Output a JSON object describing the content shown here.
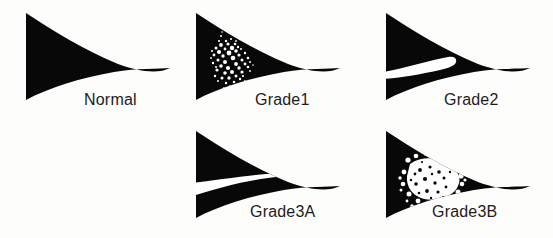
{
  "figure": {
    "background_color": "#fdfdfc",
    "meniscus_color": "#080808",
    "lesion_color": "#ffffff",
    "label_color": "#1c1c1c",
    "panel_count": 5
  },
  "panels": [
    {
      "id": "normal",
      "label": "Normal",
      "lesion_type": "none",
      "lesion_name": "no-lesion",
      "description": "Normal meniscus, homogeneous low signal triangular cross-section",
      "shape_name": "meniscus-triangle",
      "x": 22,
      "y": 8,
      "width": 152,
      "height": 110,
      "label_x": 84,
      "label_y": 92
    },
    {
      "id": "grade1",
      "label": "Grade1",
      "lesion_type": "speckle-oval",
      "lesion_name": "globular-intrasubstance-signal",
      "description": "Grade 1: globular intrasubstance increased signal not contacting articular surface",
      "shape_name": "meniscus-triangle",
      "x": 192,
      "y": 8,
      "width": 152,
      "height": 110,
      "label_x": 255,
      "label_y": 92
    },
    {
      "id": "grade2",
      "label": "Grade2",
      "lesion_type": "linear-band",
      "lesion_name": "horizontal-linear-signal",
      "description": "Grade 2: horizontal linear intrasubstance signal not extending to articular surface",
      "shape_name": "meniscus-triangle",
      "x": 382,
      "y": 8,
      "width": 152,
      "height": 110,
      "label_x": 444,
      "label_y": 92
    },
    {
      "id": "grade3a",
      "label": "Grade3A",
      "lesion_type": "full-thickness-cleft",
      "lesion_name": "linear-tear-to-surface",
      "description": "Grade 3A: linear signal extending through to the articular surface",
      "shape_name": "meniscus-triangle",
      "x": 192,
      "y": 126,
      "width": 152,
      "height": 110,
      "label_x": 250,
      "label_y": 204
    },
    {
      "id": "grade3b",
      "label": "Grade3B",
      "lesion_type": "irregular-speckle-breach",
      "lesion_name": "complex-tear-to-surface",
      "description": "Grade 3B: irregular complex signal breaching the articular surface",
      "shape_name": "meniscus-triangle",
      "x": 382,
      "y": 126,
      "width": 152,
      "height": 110,
      "label_x": 432,
      "label_y": 204
    }
  ]
}
